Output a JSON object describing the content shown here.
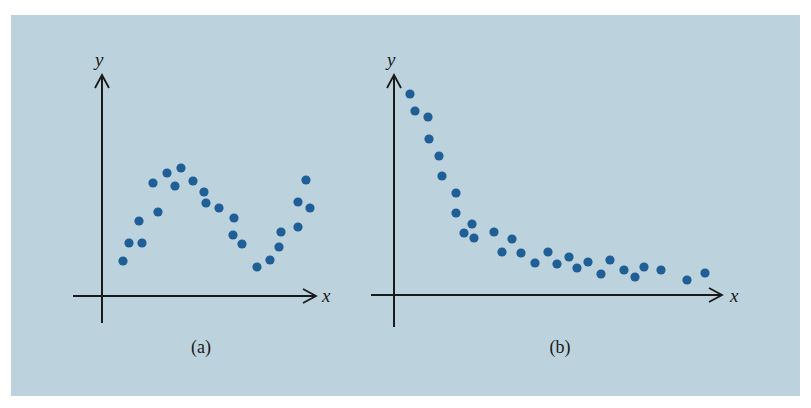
{
  "figure": {
    "background_color": "#bcd3de",
    "dot_color": "#1f5f95",
    "axis_color": "#1a1a1a"
  },
  "chart_data": [
    {
      "type": "scatter",
      "panel": "a",
      "caption": "(a)",
      "xlabel": "x",
      "ylabel": "y",
      "grid": false,
      "description": "Scatter showing an oscillating (wave-like) relationship: rises to a peak, falls to a trough, rises again",
      "pixel_axes": {
        "origin": [
          102,
          296
        ],
        "x_end": 316,
        "y_end": 75,
        "y_bottom": 323,
        "x_start": 73
      },
      "points": [
        [
          123,
          261
        ],
        [
          129,
          243
        ],
        [
          139,
          221
        ],
        [
          142,
          243
        ],
        [
          153,
          183
        ],
        [
          158,
          212
        ],
        [
          167,
          173
        ],
        [
          175,
          186
        ],
        [
          181,
          168
        ],
        [
          193,
          181
        ],
        [
          204,
          192
        ],
        [
          206,
          203
        ],
        [
          219,
          208
        ],
        [
          234,
          218
        ],
        [
          233,
          235
        ],
        [
          242,
          244
        ],
        [
          257,
          267
        ],
        [
          270,
          260
        ],
        [
          279,
          247
        ],
        [
          281,
          232
        ],
        [
          298,
          227
        ],
        [
          298,
          202
        ],
        [
          306,
          180
        ],
        [
          310,
          208
        ]
      ]
    },
    {
      "type": "scatter",
      "panel": "b",
      "caption": "(b)",
      "xlabel": "x",
      "ylabel": "y",
      "grid": false,
      "description": "Scatter showing a decaying (exponential-like) relationship: high near y-axis, dropping steeply then leveling off",
      "pixel_axes": {
        "origin": [
          394,
          295
        ],
        "x_end": 722,
        "y_end": 75,
        "y_bottom": 327,
        "x_start": 371
      },
      "points": [
        [
          410,
          94
        ],
        [
          415,
          111
        ],
        [
          428,
          117
        ],
        [
          429,
          139
        ],
        [
          439,
          156
        ],
        [
          442,
          176
        ],
        [
          456,
          193
        ],
        [
          456,
          213
        ],
        [
          472,
          224
        ],
        [
          464,
          233
        ],
        [
          474,
          238
        ],
        [
          494,
          232
        ],
        [
          512,
          239
        ],
        [
          502,
          252
        ],
        [
          521,
          253
        ],
        [
          535,
          263
        ],
        [
          548,
          252
        ],
        [
          557,
          264
        ],
        [
          569,
          257
        ],
        [
          577,
          268
        ],
        [
          588,
          262
        ],
        [
          601,
          274
        ],
        [
          610,
          260
        ],
        [
          624,
          270
        ],
        [
          635,
          277
        ],
        [
          644,
          267
        ],
        [
          661,
          270
        ],
        [
          687,
          280
        ],
        [
          705,
          273
        ]
      ]
    }
  ]
}
